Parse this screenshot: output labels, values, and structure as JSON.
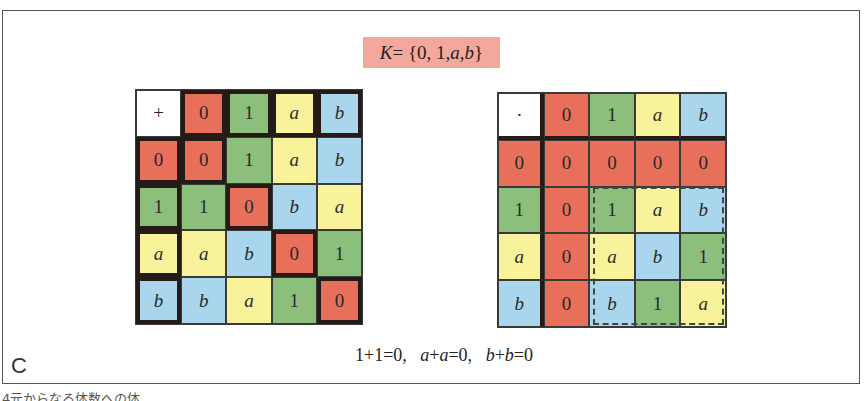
{
  "title": {
    "lhs": "K",
    "eq": " = {0, 1, ",
    "a": "a",
    "comma": ", ",
    "b": "b",
    "close": "}",
    "full": "K = {0, 1, a, b}",
    "background": "#f4a89b"
  },
  "colors": {
    "0": "#e8705a",
    "1": "#8cbf7c",
    "a": "#f8f29a",
    "b": "#a9d6ec",
    "header": "#ffffff"
  },
  "addition_table": {
    "operator": "+",
    "header": [
      "0",
      "1",
      "a",
      "b"
    ],
    "rows": [
      {
        "label": "0",
        "values": [
          "0",
          "1",
          "a",
          "b"
        ]
      },
      {
        "label": "1",
        "values": [
          "1",
          "0",
          "b",
          "a"
        ]
      },
      {
        "label": "a",
        "values": [
          "a",
          "b",
          "0",
          "1"
        ]
      },
      {
        "label": "b",
        "values": [
          "b",
          "a",
          "1",
          "0"
        ]
      }
    ]
  },
  "multiplication_table": {
    "operator": "·",
    "header": [
      "0",
      "1",
      "a",
      "b"
    ],
    "rows": [
      {
        "label": "0",
        "values": [
          "0",
          "0",
          "0",
          "0"
        ]
      },
      {
        "label": "1",
        "values": [
          "0",
          "1",
          "a",
          "b"
        ]
      },
      {
        "label": "a",
        "values": [
          "0",
          "a",
          "b",
          "1"
        ]
      },
      {
        "label": "b",
        "values": [
          "0",
          "b",
          "1",
          "a"
        ]
      }
    ]
  },
  "panel_label": "C",
  "equation": {
    "p1": "1+1=0,   ",
    "a1": "a",
    "p2": "+",
    "a2": "a",
    "p3": "=0,   ",
    "b1": "b",
    "p4": "+",
    "b2": "b",
    "p5": "=0"
  },
  "caption": "4元からなる体数への体"
}
